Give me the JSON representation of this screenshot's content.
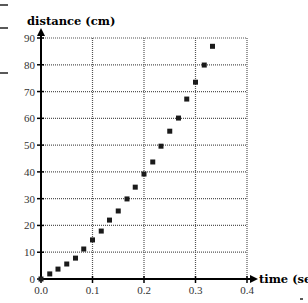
{
  "chart_data": {
    "type": "scatter",
    "title": "",
    "xlabel": "time (sec)",
    "ylabel": "distance (cm)",
    "xlim": [
      0,
      0.4
    ],
    "ylim": [
      0,
      90
    ],
    "xticks": [
      "0.0",
      "0.1",
      "0.2",
      "0.3",
      "0.4"
    ],
    "yticks": [
      "0",
      "10",
      "20",
      "30",
      "40",
      "50",
      "60",
      "70",
      "80",
      "90"
    ],
    "grid": true,
    "grid_style": "dotted",
    "legend": null,
    "marker": "square",
    "series": [
      {
        "name": "distance vs time",
        "x": [
          0.0,
          0.017,
          0.033,
          0.05,
          0.067,
          0.083,
          0.1,
          0.117,
          0.133,
          0.15,
          0.167,
          0.183,
          0.2,
          0.217,
          0.233,
          0.25,
          0.267,
          0.283,
          0.3,
          0.317,
          0.333
        ],
        "y": [
          0.0,
          1.9,
          3.7,
          5.6,
          7.8,
          11.2,
          14.6,
          17.9,
          22.0,
          25.4,
          29.9,
          34.3,
          39.2,
          43.7,
          49.6,
          55.2,
          60.1,
          67.2,
          73.5,
          79.9,
          86.9
        ]
      }
    ]
  },
  "colors": {
    "axis": "#000000",
    "grid": "#555555",
    "marker": "#1a1a1a",
    "background": "#ffffff"
  }
}
